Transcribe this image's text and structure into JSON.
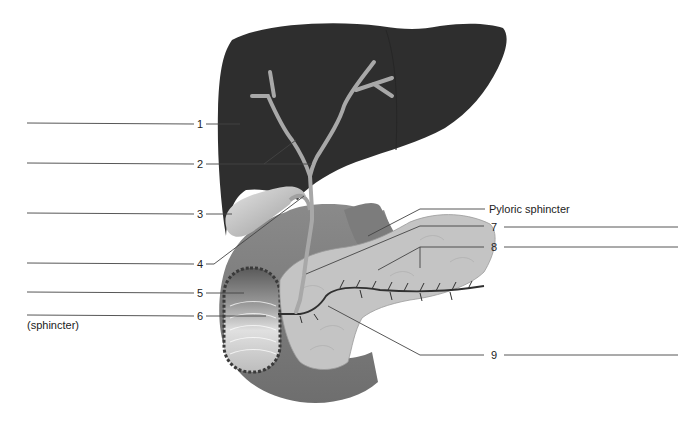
{
  "figure": {
    "type": "anatomical-diagram"
  },
  "labels": {
    "l1": "1",
    "l2": "2",
    "l3": "3",
    "l4": "4",
    "l5": "5",
    "l6": "6",
    "l7": "7",
    "l8": "8",
    "l9": "9",
    "pyloric": "Pyloric sphincter",
    "sphincter_note": "(sphincter)"
  },
  "answer_blanks": [
    {
      "id": "1",
      "side": "left",
      "value": ""
    },
    {
      "id": "2",
      "side": "left",
      "value": ""
    },
    {
      "id": "3",
      "side": "left",
      "value": ""
    },
    {
      "id": "4",
      "side": "left",
      "value": ""
    },
    {
      "id": "5",
      "side": "left",
      "value": ""
    },
    {
      "id": "6",
      "side": "left",
      "value": ""
    },
    {
      "id": "7",
      "side": "right",
      "value": ""
    },
    {
      "id": "8",
      "side": "right",
      "value": ""
    },
    {
      "id": "9",
      "side": "right",
      "value": ""
    }
  ],
  "colors": {
    "liver": "#2e2e2e",
    "duct": "#a8a8a8",
    "gallbladder": "#c9c9c9",
    "duodenum": "#808080",
    "pancreas": "#c4c4c4",
    "leader_line": "#444444"
  }
}
